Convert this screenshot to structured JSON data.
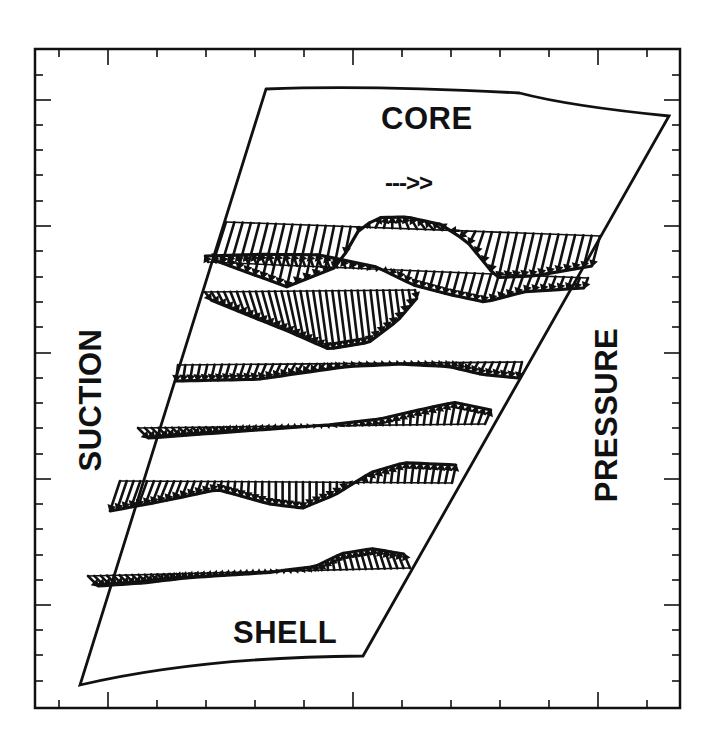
{
  "labels": {
    "core": "CORE",
    "shell": "SHELL",
    "suction": "SUCTION",
    "pressure": "PRESSURE",
    "flow_direction": "--->>"
  },
  "colors": {
    "ink": "#111111",
    "background": "#ffffff"
  },
  "frame": {
    "x0": 35,
    "y0": 49,
    "x1": 680,
    "y1": 708,
    "x_ticks": {
      "major": [
        108,
        353,
        598
      ],
      "minor": [
        59,
        157,
        206,
        255,
        304,
        402,
        451,
        500,
        549,
        647
      ]
    },
    "y_ticks": {
      "major": [
        100,
        226,
        353,
        479,
        605
      ],
      "minor": [
        75,
        125,
        150,
        175,
        201,
        251,
        277,
        302,
        327,
        378,
        403,
        428,
        454,
        504,
        529,
        555,
        580,
        630,
        655,
        681
      ]
    }
  },
  "duct": {
    "top_left": [
      266,
      89
    ],
    "top_mid": [
      370,
      87
    ],
    "top_right": [
      669,
      116
    ],
    "bottom_right": [
      363,
      656
    ],
    "bottom_mid": [
      200,
      665
    ],
    "bottom_left": [
      80,
      685
    ]
  },
  "vector_rows": [
    {
      "name": "station-1",
      "x0": 226,
      "x1": 600,
      "y0": 222,
      "y1": 236,
      "n": 46,
      "profile": [
        [
          0,
          -38,
          -12
        ],
        [
          0.2,
          -62,
          -14
        ],
        [
          0.32,
          -40,
          -8
        ],
        [
          0.36,
          0,
          0
        ],
        [
          0.4,
          10,
          5
        ],
        [
          0.5,
          12,
          -6
        ],
        [
          0.6,
          6,
          -10
        ],
        [
          0.66,
          -10,
          -6
        ],
        [
          0.75,
          -45,
          -10
        ],
        [
          0.85,
          -42,
          -10
        ],
        [
          1,
          -30,
          -8
        ]
      ]
    },
    {
      "name": "station-2",
      "x0": 208,
      "x1": 588,
      "y0": 262,
      "y1": 278,
      "n": 48,
      "profile": [
        [
          0,
          6,
          -3
        ],
        [
          0.15,
          10,
          -4
        ],
        [
          0.3,
          12,
          -4
        ],
        [
          0.45,
          2,
          -2
        ],
        [
          0.55,
          -14,
          -4
        ],
        [
          0.65,
          -22,
          -6
        ],
        [
          0.75,
          -28,
          -8
        ],
        [
          0.85,
          -16,
          -6
        ],
        [
          1,
          -10,
          -4
        ]
      ]
    },
    {
      "name": "station-3",
      "x0": 205,
      "x1": 415,
      "y0": 292,
      "y1": 290,
      "n": 34,
      "profile": [
        [
          0,
          -8,
          6
        ],
        [
          0.15,
          -22,
          8
        ],
        [
          0.35,
          -40,
          10
        ],
        [
          0.55,
          -58,
          8
        ],
        [
          0.75,
          -52,
          6
        ],
        [
          0.9,
          -30,
          4
        ],
        [
          1,
          -8,
          2
        ]
      ]
    },
    {
      "name": "station-4",
      "x0": 178,
      "x1": 522,
      "y0": 365,
      "y1": 362,
      "n": 48,
      "profile": [
        [
          0,
          -16,
          -2
        ],
        [
          0.25,
          -15,
          -6
        ],
        [
          0.4,
          -8,
          -6
        ],
        [
          0.5,
          -3,
          -3
        ],
        [
          0.65,
          -1,
          -1
        ],
        [
          0.8,
          -4,
          -4
        ],
        [
          0.9,
          -12,
          -6
        ],
        [
          1,
          -16,
          -4
        ]
      ]
    },
    {
      "name": "station-5",
      "x0": 138,
      "x1": 485,
      "y0": 428,
      "y1": 424,
      "n": 52,
      "profile": [
        [
          0,
          -10,
          10
        ],
        [
          0.2,
          -6,
          6
        ],
        [
          0.4,
          -2,
          2
        ],
        [
          0.55,
          1,
          1
        ],
        [
          0.7,
          6,
          -2
        ],
        [
          0.82,
          16,
          2
        ],
        [
          0.9,
          22,
          4
        ],
        [
          1,
          14,
          6
        ]
      ]
    },
    {
      "name": "station-6",
      "x0": 120,
      "x1": 452,
      "y0": 481,
      "y1": 483,
      "n": 50,
      "profile": [
        [
          0,
          -30,
          -10
        ],
        [
          0.15,
          -20,
          -8
        ],
        [
          0.3,
          -8,
          -2
        ],
        [
          0.45,
          -22,
          0
        ],
        [
          0.55,
          -26,
          0
        ],
        [
          0.65,
          -12,
          0
        ],
        [
          0.75,
          10,
          2
        ],
        [
          0.85,
          20,
          2
        ],
        [
          1,
          18,
          4
        ]
      ]
    },
    {
      "name": "station-7",
      "x0": 88,
      "x1": 410,
      "y0": 576,
      "y1": 568,
      "n": 52,
      "profile": [
        [
          0,
          -10,
          10
        ],
        [
          0.15,
          -8,
          8
        ],
        [
          0.3,
          -4,
          4
        ],
        [
          0.55,
          -1,
          2
        ],
        [
          0.7,
          4,
          2
        ],
        [
          0.8,
          16,
          -4
        ],
        [
          0.9,
          20,
          -6
        ],
        [
          1,
          14,
          -6
        ]
      ]
    }
  ]
}
